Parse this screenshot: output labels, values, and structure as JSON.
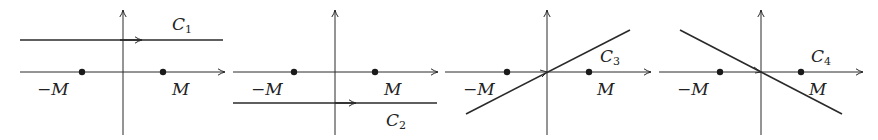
{
  "figure": {
    "colors": {
      "stroke": "#2a2a2a",
      "background": "#ffffff"
    },
    "panels": [
      {
        "id": "panel-1",
        "contour_name": "C",
        "contour_index": "1",
        "contour_type": "horizontal line above real axis",
        "point_labels": {
          "neg": "−M",
          "pos": "M"
        }
      },
      {
        "id": "panel-2",
        "contour_name": "C",
        "contour_index": "2",
        "contour_type": "horizontal line below real axis",
        "point_labels": {
          "neg": "−M",
          "pos": "M"
        }
      },
      {
        "id": "panel-3",
        "contour_name": "C",
        "contour_index": "3",
        "contour_type": "line through origin with positive slope",
        "point_labels": {
          "neg": "−M",
          "pos": "M"
        }
      },
      {
        "id": "panel-4",
        "contour_name": "C",
        "contour_index": "4",
        "contour_type": "line through origin with negative slope",
        "point_labels": {
          "neg": "−M",
          "pos": "M"
        }
      }
    ]
  }
}
